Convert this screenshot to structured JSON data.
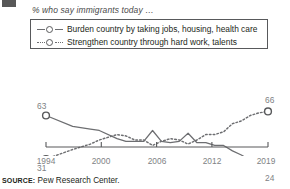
{
  "subtitle": "% who say immigrants today …",
  "legend": {
    "items": [
      {
        "label": "Burden country by taking jobs, housing, health care",
        "style": "solid",
        "marker": "open-circle"
      },
      {
        "label": "Strengthen country through hard work, talents",
        "style": "dotted",
        "marker": "open-circle"
      }
    ]
  },
  "source": {
    "prefix": "SOURCE:",
    "text": " Pew Research Center."
  },
  "endpoint_labels": {
    "burden_start": "63",
    "burden_end": "24",
    "strengthen_start": "31",
    "strengthen_end": "66"
  },
  "chart_data": {
    "type": "line",
    "title": "",
    "subtitle": "% who say immigrants today …",
    "xlabel": "",
    "ylabel": "",
    "xlim": [
      1994,
      2019
    ],
    "ylim": [
      20,
      70
    ],
    "grid": false,
    "legend_position": "top",
    "xticks": [
      "1994",
      "2000",
      "2006",
      "2012",
      "2019"
    ],
    "xtick_values": [
      1994,
      2000,
      2006,
      2012,
      2019
    ],
    "series": [
      {
        "name": "Burden country by taking jobs, housing, health care",
        "style": "solid",
        "color": "#6d6e71",
        "endpoint_labels": {
          "start": 63,
          "end": 24
        },
        "x": [
          1994,
          1997,
          1999,
          2000,
          2002,
          2003,
          2004,
          2005,
          2006,
          2007,
          2008,
          2009,
          2010,
          2011,
          2012,
          2013,
          2014,
          2015,
          2016,
          2017,
          2018,
          2019
        ],
        "values": [
          63,
          55,
          53,
          52,
          46,
          44,
          44,
          44,
          52,
          44,
          43,
          44,
          50,
          43,
          43,
          41,
          41,
          37,
          34,
          30,
          27,
          24
        ]
      },
      {
        "name": "Strengthen country through hard work, talents",
        "style": "dotted",
        "color": "#6d6e71",
        "endpoint_labels": {
          "start": 31,
          "end": 66
        },
        "x": [
          1994,
          1997,
          1999,
          2000,
          2002,
          2003,
          2004,
          2005,
          2006,
          2007,
          2008,
          2009,
          2010,
          2011,
          2012,
          2013,
          2014,
          2015,
          2016,
          2017,
          2018,
          2019
        ],
        "values": [
          31,
          38,
          42,
          45,
          49,
          48,
          45,
          45,
          41,
          44,
          46,
          45,
          42,
          45,
          49,
          49,
          51,
          57,
          59,
          63,
          65,
          66
        ]
      }
    ]
  }
}
